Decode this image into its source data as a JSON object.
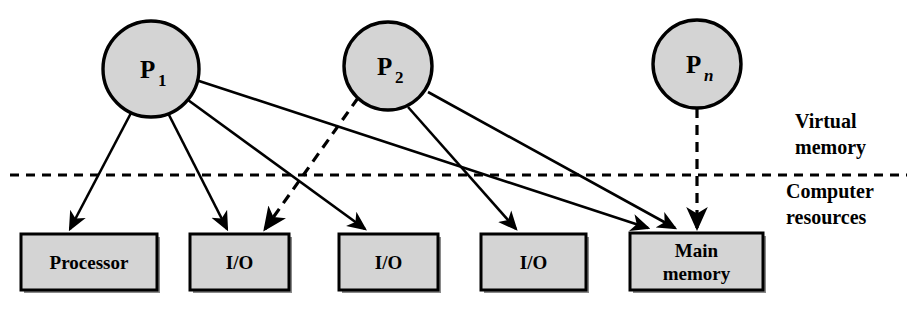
{
  "diagram": {
    "colors": {
      "node_fill": "#d4d4d4",
      "stroke": "#000000",
      "background": "#ffffff",
      "box_fill": "#d4d4d4"
    },
    "processes": [
      {
        "id": "p1",
        "base": "P",
        "sub": "1",
        "sub_italic": false,
        "cx": 151,
        "cy": 69,
        "r": 48
      },
      {
        "id": "p2",
        "base": "P",
        "sub": "2",
        "sub_italic": false,
        "cx": 388,
        "cy": 66,
        "r": 44
      },
      {
        "id": "pn",
        "base": "P",
        "sub": "n",
        "sub_italic": true,
        "cx": 697,
        "cy": 64,
        "r": 44
      }
    ],
    "resources": [
      {
        "id": "processor",
        "label": "Processor",
        "line2": "",
        "x": 21,
        "y": 234,
        "w": 136,
        "h": 56
      },
      {
        "id": "io-1",
        "label": "I/O",
        "line2": "",
        "x": 190,
        "y": 234,
        "w": 99,
        "h": 56
      },
      {
        "id": "io-2",
        "label": "I/O",
        "line2": "",
        "x": 339,
        "y": 234,
        "w": 99,
        "h": 56
      },
      {
        "id": "io-3",
        "label": "I/O",
        "line2": "",
        "x": 481,
        "y": 234,
        "w": 105,
        "h": 56
      },
      {
        "id": "main-memory",
        "label": "Main",
        "line2": "memory",
        "x": 630,
        "y": 233,
        "w": 133,
        "h": 57
      }
    ],
    "divider": {
      "y": 175,
      "x1": 10,
      "x2": 907,
      "style": "dashed"
    },
    "side_labels": [
      {
        "id": "virtual-memory",
        "line1": "Virtual",
        "line2": "memory",
        "x": 795,
        "y": 128
      },
      {
        "id": "computer-resources",
        "line1": "Computer",
        "line2": "resources",
        "x": 786,
        "y": 198
      }
    ],
    "connections": [
      {
        "id": "p1-processor",
        "from": "p1",
        "to": "processor",
        "style": "solid",
        "x1": 131,
        "y1": 113,
        "x2": 70,
        "y2": 229
      },
      {
        "id": "p1-io-1",
        "from": "p1",
        "to": "io-1",
        "style": "solid",
        "x1": 168,
        "y1": 113,
        "x2": 227,
        "y2": 229
      },
      {
        "id": "p1-io-2",
        "from": "p1",
        "to": "io-2",
        "style": "solid",
        "x1": 188,
        "y1": 100,
        "x2": 365,
        "y2": 229
      },
      {
        "id": "p1-main-memory",
        "from": "p1",
        "to": "main-memory",
        "style": "solid",
        "x1": 196,
        "y1": 80,
        "x2": 648,
        "y2": 228
      },
      {
        "id": "p2-io-1",
        "from": "p2",
        "to": "io-1",
        "style": "dashed",
        "x1": 358,
        "y1": 98,
        "x2": 265,
        "y2": 229
      },
      {
        "id": "p2-io-3",
        "from": "p2",
        "to": "io-3",
        "style": "solid",
        "x1": 408,
        "y1": 107,
        "x2": 516,
        "y2": 229
      },
      {
        "id": "p2-main-memory",
        "from": "p2",
        "to": "main-memory",
        "style": "solid",
        "x1": 428,
        "y1": 92,
        "x2": 675,
        "y2": 228
      },
      {
        "id": "pn-main-memory",
        "from": "pn",
        "to": "main-memory",
        "style": "dashed",
        "x1": 697,
        "y1": 108,
        "x2": 697,
        "y2": 228
      }
    ]
  }
}
